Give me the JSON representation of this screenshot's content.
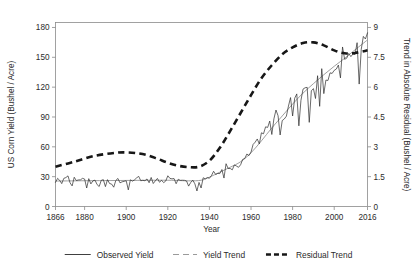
{
  "chart_data": {
    "type": "line",
    "title": "",
    "xlabel": "Year",
    "ylabel": "US Corn Yield (Bushel / Acre)",
    "y2label": "Trend in Absolute Residual (Bushel / Acre)",
    "xlim": [
      1866,
      2016
    ],
    "ylim": [
      0,
      185
    ],
    "y2lim": [
      0,
      9.25
    ],
    "grid": false,
    "legend_position": "bottom",
    "xticks": [
      1866,
      1880,
      1900,
      1920,
      1940,
      1960,
      1980,
      2000,
      2016
    ],
    "xtick_labels": [
      "1866",
      "1880",
      "1900",
      "1920",
      "1940",
      "1960",
      "1980",
      "2000",
      "2016"
    ],
    "yticks": [
      0,
      30,
      60,
      90,
      120,
      150,
      180
    ],
    "ytick_labels": [
      "0",
      "30",
      "60",
      "90",
      "120",
      "150",
      "180"
    ],
    "y2ticks": [
      0,
      1.5,
      3,
      4.5,
      6,
      7.5,
      9
    ],
    "y2tick_labels": [
      "0",
      "1.5",
      "3",
      "4.5",
      "6",
      "7.5",
      "9"
    ],
    "legend": [
      {
        "label": "Observed Yield",
        "style": "solid",
        "color": "#2a2a2a"
      },
      {
        "label": "Yield Trend",
        "style": "dashed-light",
        "color": "#9a9a9a"
      },
      {
        "label": "Residual Trend",
        "style": "dashed-bold",
        "color": "#171717"
      }
    ],
    "series": [
      {
        "name": "Observed Yield",
        "axis": "left",
        "x": [
          1866,
          1867,
          1868,
          1869,
          1870,
          1871,
          1872,
          1873,
          1874,
          1875,
          1876,
          1877,
          1878,
          1879,
          1880,
          1881,
          1882,
          1883,
          1884,
          1885,
          1886,
          1887,
          1888,
          1889,
          1890,
          1891,
          1892,
          1893,
          1894,
          1895,
          1896,
          1897,
          1898,
          1899,
          1900,
          1901,
          1902,
          1903,
          1904,
          1905,
          1906,
          1907,
          1908,
          1909,
          1910,
          1911,
          1912,
          1913,
          1914,
          1915,
          1916,
          1917,
          1918,
          1919,
          1920,
          1921,
          1922,
          1923,
          1924,
          1925,
          1926,
          1927,
          1928,
          1929,
          1930,
          1931,
          1932,
          1933,
          1934,
          1935,
          1936,
          1937,
          1938,
          1939,
          1940,
          1941,
          1942,
          1943,
          1944,
          1945,
          1946,
          1947,
          1948,
          1949,
          1950,
          1951,
          1952,
          1953,
          1954,
          1955,
          1956,
          1957,
          1958,
          1959,
          1960,
          1961,
          1962,
          1963,
          1964,
          1965,
          1966,
          1967,
          1968,
          1969,
          1970,
          1971,
          1972,
          1973,
          1974,
          1975,
          1976,
          1977,
          1978,
          1979,
          1980,
          1981,
          1982,
          1983,
          1984,
          1985,
          1986,
          1987,
          1988,
          1989,
          1990,
          1991,
          1992,
          1993,
          1994,
          1995,
          1996,
          1997,
          1998,
          1999,
          2000,
          2001,
          2002,
          2003,
          2004,
          2005,
          2006,
          2007,
          2008,
          2009,
          2010,
          2011,
          2012,
          2013,
          2014,
          2015,
          2016
        ],
        "values": [
          24.3,
          28.3,
          26.3,
          23.0,
          28.3,
          29.1,
          30.8,
          23.8,
          20.7,
          29.4,
          26.1,
          26.7,
          26.8,
          28.3,
          27.6,
          18.6,
          28.0,
          22.7,
          25.8,
          26.5,
          22.0,
          20.1,
          26.3,
          27.0,
          20.0,
          27.0,
          23.1,
          22.5,
          19.4,
          26.2,
          28.2,
          23.8,
          24.8,
          25.3,
          25.9,
          16.7,
          26.8,
          25.5,
          26.8,
          28.8,
          30.3,
          25.9,
          26.3,
          25.9,
          27.7,
          23.9,
          29.2,
          23.1,
          25.8,
          28.2,
          24.4,
          26.3,
          24.0,
          25.6,
          30.9,
          28.3,
          27.8,
          28.1,
          22.9,
          27.4,
          26.3,
          26.4,
          26.3,
          25.7,
          20.5,
          24.1,
          26.5,
          22.8,
          15.6,
          24.2,
          18.6,
          28.9,
          27.8,
          29.1,
          28.4,
          31.2,
          35.4,
          32.2,
          33.3,
          33.1,
          37.2,
          28.6,
          43.0,
          38.2,
          38.2,
          36.9,
          41.8,
          40.7,
          39.4,
          42.0,
          47.4,
          48.3,
          52.8,
          51.2,
          54.7,
          62.4,
          64.7,
          67.9,
          62.9,
          74.1,
          73.1,
          80.1,
          79.5,
          85.9,
          72.4,
          88.1,
          97.0,
          91.3,
          71.9,
          86.4,
          88.0,
          90.8,
          101.0,
          109.5,
          91.0,
          108.9,
          113.2,
          81.1,
          106.7,
          118.0,
          119.4,
          119.8,
          84.6,
          116.3,
          118.5,
          108.6,
          131.5,
          100.7,
          138.6,
          113.5,
          127.1,
          126.7,
          134.4,
          133.8,
          136.9,
          138.2,
          142.2,
          129.3,
          160.4,
          148.0,
          149.1,
          153.9,
          150.7,
          153.3,
          152.8,
          164.7,
          123.1,
          158.1,
          171.0,
          168.4,
          174.6
        ]
      },
      {
        "name": "Yield Trend",
        "axis": "left",
        "x": [
          1866,
          1880,
          1900,
          1920,
          1930,
          1936,
          1940,
          1945,
          1950,
          1955,
          1960,
          1965,
          1970,
          1975,
          1980,
          1985,
          1990,
          1995,
          2000,
          2005,
          2010,
          2016
        ],
        "values": [
          25.6,
          25.9,
          26.2,
          26.4,
          25.8,
          26.4,
          29.5,
          34.5,
          39.5,
          45.0,
          54.0,
          66.0,
          79.0,
          91.0,
          103.0,
          114.0,
          123.5,
          132.5,
          141.0,
          149.0,
          157.5,
          167.5
        ]
      },
      {
        "name": "Residual Trend",
        "axis": "right",
        "x": [
          1866,
          1875,
          1885,
          1895,
          1900,
          1905,
          1910,
          1915,
          1920,
          1925,
          1930,
          1935,
          1940,
          1945,
          1950,
          1955,
          1960,
          1965,
          1970,
          1975,
          1980,
          1985,
          1990,
          1995,
          2000,
          2005,
          2010,
          2016
        ],
        "values": [
          2.0,
          2.25,
          2.55,
          2.7,
          2.72,
          2.68,
          2.58,
          2.4,
          2.2,
          2.05,
          1.98,
          2.0,
          2.3,
          2.95,
          3.8,
          4.7,
          5.6,
          6.45,
          7.1,
          7.65,
          8.0,
          8.22,
          8.25,
          8.1,
          7.85,
          7.7,
          7.72,
          7.85
        ]
      }
    ]
  }
}
